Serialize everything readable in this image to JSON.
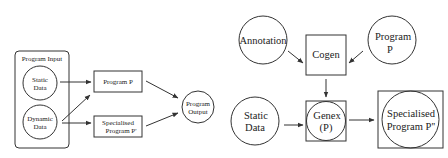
{
  "left_diagram": {
    "group": {
      "label": "Program Input"
    },
    "nodes": {
      "static_data": {
        "line1": "Static",
        "line2": "Data"
      },
      "dynamic_data": {
        "line1": "Dynamic",
        "line2": "Data"
      },
      "program_p": {
        "label": "Program P"
      },
      "specialised": {
        "line1": "Specialised",
        "line2": "Program P'"
      },
      "output": {
        "line1": "Program",
        "line2": "Output"
      }
    },
    "edges": [
      {
        "from": "Static Data",
        "to": "Program P"
      },
      {
        "from": "Dynamic Data",
        "to": "Program P"
      },
      {
        "from": "Dynamic Data",
        "to": "Specialised Program P'"
      },
      {
        "from": "Program P",
        "to": "Program Output"
      },
      {
        "from": "Specialised Program P'",
        "to": "Program Output"
      }
    ]
  },
  "right_diagram": {
    "nodes": {
      "annotation": {
        "label": "Annotation"
      },
      "cogen": {
        "label": "Cogen"
      },
      "program_p": {
        "line1": "Program",
        "line2": "P"
      },
      "static_data": {
        "line1": "Static",
        "line2": "Data"
      },
      "genex": {
        "line1": "Genex",
        "line2": "(P)"
      },
      "specialised": {
        "line1": "Specialised",
        "line2": "Program P''"
      }
    },
    "edges": [
      {
        "from": "Annotation",
        "to": "Cogen"
      },
      {
        "from": "Program P",
        "to": "Cogen"
      },
      {
        "from": "Cogen",
        "to": "Genex (P)"
      },
      {
        "from": "Static Data",
        "to": "Genex (P)"
      },
      {
        "from": "Genex (P)",
        "to": "Specialised Program P''"
      }
    ]
  },
  "colors": {
    "stroke": "#333333",
    "text": "#222222",
    "background": "#ffffff"
  }
}
